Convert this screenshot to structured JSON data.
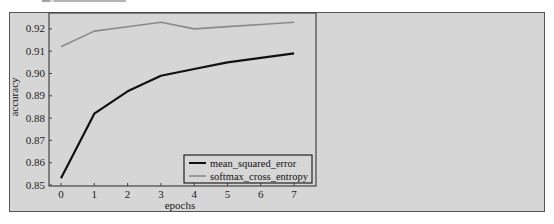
{
  "chart_data": {
    "type": "line",
    "title": "",
    "xlabel": "epochs",
    "ylabel": "accuracy",
    "x": [
      0,
      1,
      2,
      3,
      4,
      5,
      6,
      7
    ],
    "xticks": [
      "0",
      "1",
      "2",
      "3",
      "4",
      "5",
      "6",
      "7"
    ],
    "yticks": [
      "0.85",
      "0.86",
      "0.87",
      "0.88",
      "0.89",
      "0.90",
      "0.91",
      "0.92"
    ],
    "ylim": [
      0.85,
      0.926
    ],
    "xlim": [
      -0.35,
      7.65
    ],
    "grid": false,
    "legend_position": "lower right",
    "series": [
      {
        "name": "mean_squared_error",
        "color": "#111111",
        "values": [
          0.853,
          0.882,
          0.892,
          0.899,
          0.902,
          0.905,
          0.907,
          0.909
        ]
      },
      {
        "name": "softmax_cross_entropy",
        "color": "#8a8a8a",
        "values": [
          0.912,
          0.919,
          0.921,
          0.923,
          0.92,
          0.921,
          0.922,
          0.923
        ]
      }
    ]
  },
  "colors": {
    "frame_bg": "#d6d6d6",
    "axis": "#444444"
  }
}
